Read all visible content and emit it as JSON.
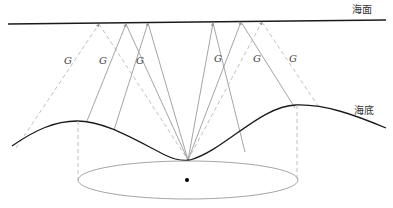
{
  "labels": {
    "sea_surface": "海面",
    "seabed": "海底",
    "ray_label": "G"
  },
  "colors": {
    "surface_line": "#1a1a1a",
    "seabed_line": "#1a1a1a",
    "solid_ray": "#9a9a9a",
    "dashed_ray": "#b8b8b8",
    "ellipse": "#9a9a9a",
    "projection": "#b8b8b8",
    "center_dot": "#000000"
  },
  "geometry": {
    "surface": {
      "x1": 8,
      "y1": 24,
      "x2": 386,
      "y2": 20
    },
    "convergence_point": {
      "x": 188,
      "y": 160
    },
    "apexes": [
      {
        "x": 99,
        "y": 23,
        "style": "dashed",
        "outer": {
          "x": 16,
          "y": 148
        },
        "label": {
          "x": 66,
          "y": 64
        }
      },
      {
        "x": 126,
        "y": 23,
        "style": "solid",
        "outer": {
          "x": 87,
          "y": 121
        },
        "label": {
          "x": 101,
          "y": 64
        }
      },
      {
        "x": 148,
        "y": 23,
        "style": "solid",
        "outer": {
          "x": 114,
          "y": 130
        },
        "label": {
          "x": 139,
          "y": 64
        }
      },
      {
        "x": 213,
        "y": 23,
        "style": "solid",
        "outer": {
          "x": 245,
          "y": 159
        },
        "label": {
          "x": 216,
          "y": 64
        }
      },
      {
        "x": 241,
        "y": 22,
        "style": "solid",
        "outer": {
          "x": 295,
          "y": 106
        },
        "label": {
          "x": 255,
          "y": 64
        }
      },
      {
        "x": 262,
        "y": 22,
        "style": "dashed",
        "outer": {
          "x": 316,
          "y": 108
        },
        "label": {
          "x": 291,
          "y": 64
        }
      }
    ],
    "ellipse": {
      "cx": 188,
      "cy": 180,
      "rx": 110,
      "ry": 19
    },
    "center_dot": {
      "x": 187,
      "y": 180
    }
  }
}
